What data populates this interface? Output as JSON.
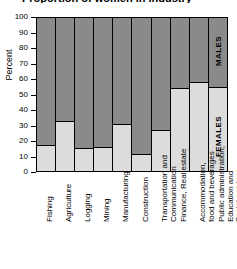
{
  "title_clipped": "Proportion of women in industry",
  "axis": {
    "ylabel": "Percent",
    "yticks": [
      "0",
      "10",
      "20",
      "30",
      "40",
      "50",
      "60",
      "70",
      "80",
      "90",
      "100"
    ]
  },
  "legend": {
    "males": "MALES",
    "females": "FEMALES",
    "males_color": "#8a8a8a",
    "females_color": "#dcdcdc"
  },
  "categories": [
    {
      "label": "Fishing",
      "lines": [
        "Fishing"
      ]
    },
    {
      "label": "Agriculture",
      "lines": [
        "Agriculture"
      ]
    },
    {
      "label": "Logging",
      "lines": [
        "Logging"
      ]
    },
    {
      "label": "Mining",
      "lines": [
        "Mining"
      ]
    },
    {
      "label": "Manufacturing",
      "lines": [
        "Manufacturing"
      ]
    },
    {
      "label": "Construction",
      "lines": [
        "Construction"
      ]
    },
    {
      "label": "Transportation and Communication",
      "lines": [
        "Transportation and",
        "Communication"
      ]
    },
    {
      "label": "Finance, Real estate",
      "lines": [
        "Finance, Real estate"
      ]
    },
    {
      "label": "Accommodation, food and beverages",
      "lines": [
        "Accommodation,",
        "food and beverages"
      ]
    },
    {
      "label": "Public administration, Education and Social services",
      "lines": [
        "Public administration,",
        "Education and",
        "Social services"
      ]
    }
  ],
  "chart_data": {
    "type": "bar",
    "stacked": true,
    "stack_total": 100,
    "title": "Proportion of women in industry",
    "xlabel": "",
    "ylabel": "Percent",
    "ylim": [
      0,
      100
    ],
    "ytick_step": 10,
    "grid": false,
    "legend_position": "in-bar",
    "categories": [
      "Fishing",
      "Agriculture",
      "Logging",
      "Mining",
      "Manufacturing",
      "Construction",
      "Transportation and Communication",
      "Finance, Real estate",
      "Accommodation, food and beverages",
      "Public administration, Education and Social services"
    ],
    "series": [
      {
        "name": "FEMALES",
        "color": "#dcdcdc",
        "values": [
          17,
          33,
          15,
          16,
          31,
          11,
          27,
          54,
          58,
          55
        ]
      },
      {
        "name": "MALES",
        "color": "#8a8a8a",
        "values": [
          83,
          67,
          85,
          84,
          69,
          89,
          73,
          46,
          42,
          45
        ]
      }
    ],
    "annotations": [
      {
        "text": "MALES",
        "bar": "Public administration, Education and Social services",
        "segment": "MALES"
      },
      {
        "text": "FEMALES",
        "bar": "Public administration, Education and Social services",
        "segment": "FEMALES"
      }
    ]
  }
}
